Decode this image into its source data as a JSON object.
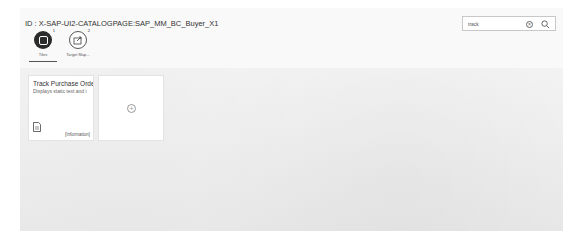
{
  "header": {
    "title": "ID : X-SAP-UI2-CATALOGPAGE:SAP_MM_BC_Buyer_X1"
  },
  "search": {
    "value": "track",
    "placeholder": "Search"
  },
  "tabs": [
    {
      "label": "Tiles",
      "count": "1",
      "icon": "tiles-icon",
      "active": true
    },
    {
      "label": "Target Map...",
      "count": "2",
      "icon": "target-mapping-icon",
      "active": false
    }
  ],
  "tiles": [
    {
      "title": "Track Purchase Order",
      "subtitle": "Displays static text and i",
      "icon": "document-icon",
      "footer": "[Information]"
    }
  ],
  "add_tile": {
    "icon": "plus-icon"
  }
}
